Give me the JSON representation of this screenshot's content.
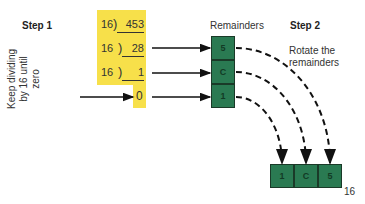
{
  "step1": {
    "title": "Step 1",
    "instruction_line1": "Keep dividing",
    "instruction_line2": "by 16 until zero"
  },
  "step2": {
    "title": "Step 2",
    "instruction_line1": "Rotate the",
    "instruction_line2": "remainders"
  },
  "remainders_label": "Remainders",
  "division": {
    "rows": [
      {
        "divisor": "16",
        "dividend": "453"
      },
      {
        "divisor": "16",
        "dividend": "28"
      },
      {
        "divisor": "16",
        "dividend": "1"
      }
    ],
    "final_quotient": "0"
  },
  "remainders": [
    "5",
    "C",
    "1"
  ],
  "result": {
    "digits": [
      "1",
      "C",
      "5"
    ],
    "base": "16"
  },
  "colors": {
    "highlight": "#f7e04a",
    "box": "#2a7a52",
    "box_border": "#1a3a28"
  }
}
